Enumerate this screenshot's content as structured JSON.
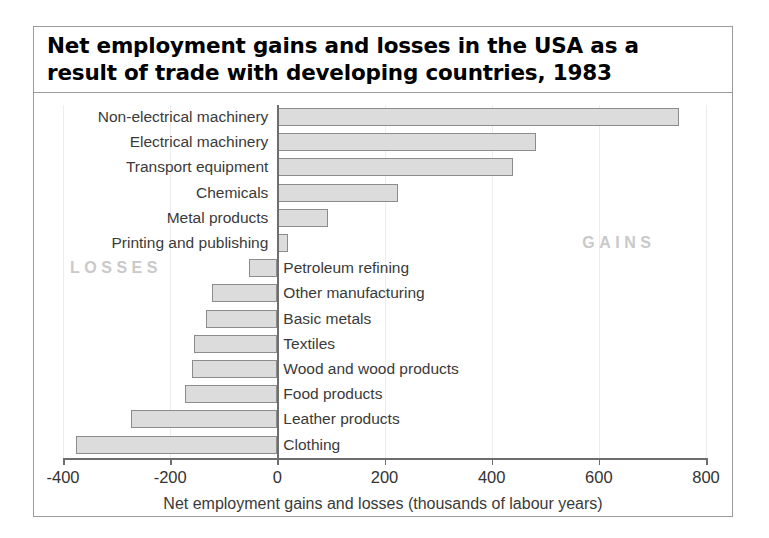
{
  "chart_data": {
    "type": "bar",
    "orientation": "horizontal",
    "title": "Net employment gains and losses in the USA as a result of trade with developing countries, 1983",
    "title_lines": [
      "Net employment gains and losses in the USA as a",
      "result of trade with developing countries, 1983"
    ],
    "xlabel": "Net employment gains and losses (thousands of labour years)",
    "ylabel": "",
    "xlim": [
      -400,
      800
    ],
    "xticks": [
      -400,
      -200,
      0,
      200,
      400,
      600,
      800
    ],
    "xtick_labels": [
      "-400",
      "-200",
      "0",
      "200",
      "400",
      "600",
      "800"
    ],
    "grid": "vertical-faint",
    "legend": "none",
    "categories": [
      "Non-electrical machinery",
      "Electrical machinery",
      "Transport equipment",
      "Chemicals",
      "Metal products",
      "Printing and publishing",
      "Petroleum refining",
      "Other manufacturing",
      "Basic metals",
      "Textiles",
      "Wood and wood products",
      "Food products",
      "Leather products",
      "Clothing"
    ],
    "values": [
      750,
      482,
      440,
      225,
      95,
      20,
      -52,
      -122,
      -133,
      -155,
      -159,
      -172,
      -273,
      -376
    ],
    "annotations": [
      {
        "text": "GAINS",
        "region": "positive"
      },
      {
        "text": "LOSSES",
        "region": "negative"
      }
    ],
    "colors": {
      "bar_fill": "#dcdcdc",
      "bar_stroke": "#8c8c8c",
      "axis": "#6e6e6e",
      "annotation_text": "#c9c9c9",
      "label_text": "#3a3a3a",
      "frame": "#9a9a9a",
      "background": "#ffffff"
    }
  }
}
